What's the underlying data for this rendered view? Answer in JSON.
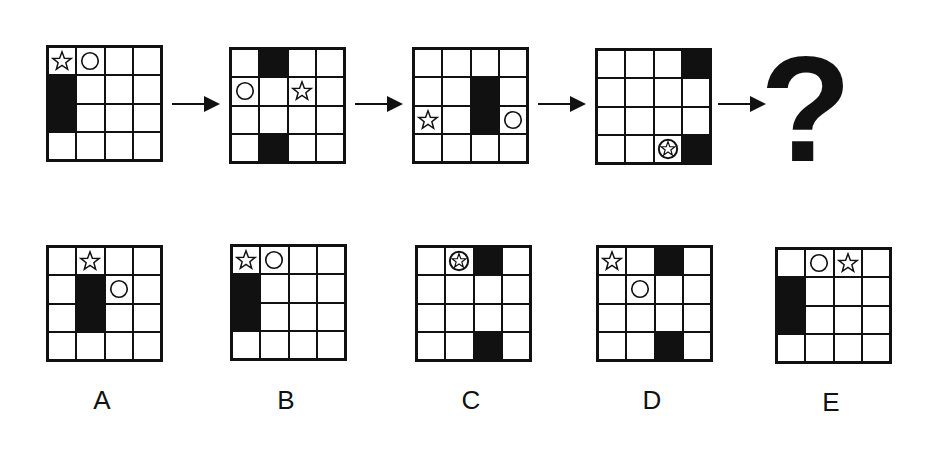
{
  "sequence": {
    "title": "",
    "grids": [
      {
        "id": "seq-1",
        "x": 46,
        "y": 45,
        "black": [
          [
            1,
            0
          ],
          [
            2,
            0
          ]
        ],
        "star": [
          0,
          0
        ],
        "circle": [
          0,
          1
        ],
        "combined": null
      },
      {
        "id": "seq-2",
        "x": 229,
        "y": 47,
        "black": [
          [
            0,
            1
          ],
          [
            3,
            1
          ]
        ],
        "star": [
          1,
          2
        ],
        "circle": [
          1,
          0
        ],
        "combined": null
      },
      {
        "id": "seq-3",
        "x": 412,
        "y": 47,
        "black": [
          [
            1,
            2
          ],
          [
            2,
            2
          ]
        ],
        "star": [
          2,
          0
        ],
        "circle": [
          2,
          3
        ],
        "combined": null
      },
      {
        "id": "seq-4",
        "x": 595,
        "y": 48,
        "black": [
          [
            0,
            3
          ],
          [
            3,
            3
          ]
        ],
        "star": null,
        "circle": null,
        "combined": [
          3,
          2
        ]
      }
    ],
    "arrows": [
      {
        "x": 172,
        "y": 95
      },
      {
        "x": 355,
        "y": 95
      },
      {
        "x": 538,
        "y": 95
      },
      {
        "x": 718,
        "y": 95
      }
    ],
    "question_mark": "?"
  },
  "options": [
    {
      "label": "A",
      "x": 46,
      "y": 245,
      "label_x": 82,
      "label_y": 385,
      "black": [
        [
          1,
          1
        ],
        [
          2,
          1
        ]
      ],
      "star": [
        0,
        1
      ],
      "circle": [
        1,
        2
      ],
      "combined": null
    },
    {
      "label": "B",
      "x": 230,
      "y": 244,
      "label_x": 266,
      "label_y": 385,
      "black": [
        [
          1,
          0
        ],
        [
          2,
          0
        ]
      ],
      "star": [
        0,
        0
      ],
      "circle": [
        0,
        1
      ],
      "combined": null
    },
    {
      "label": "C",
      "x": 415,
      "y": 245,
      "label_x": 451,
      "label_y": 385,
      "black": [
        [
          0,
          2
        ],
        [
          3,
          2
        ]
      ],
      "star": null,
      "circle": null,
      "combined": [
        0,
        1
      ]
    },
    {
      "label": "D",
      "x": 596,
      "y": 245,
      "label_x": 632,
      "label_y": 385,
      "black": [
        [
          0,
          2
        ],
        [
          3,
          2
        ]
      ],
      "star": [
        0,
        0
      ],
      "circle": [
        1,
        1
      ],
      "combined": null
    },
    {
      "label": "E",
      "x": 775,
      "y": 247,
      "label_x": 811,
      "label_y": 387,
      "black": [
        [
          1,
          0
        ],
        [
          2,
          0
        ]
      ],
      "star": [
        0,
        2
      ],
      "circle": [
        0,
        1
      ],
      "combined": null
    }
  ]
}
